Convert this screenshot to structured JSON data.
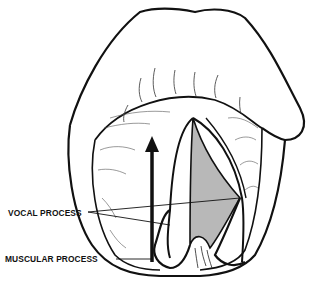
{
  "figure": {
    "labels": {
      "vocal_process": "VOCAL PROCESS",
      "muscular_process": "MUSCULAR PROCESS"
    },
    "colors": {
      "line": "#111111",
      "glottis_fill": "#b8b8b8",
      "background": "#ffffff"
    },
    "annotations": {
      "arrow": "upward-arrow"
    }
  }
}
